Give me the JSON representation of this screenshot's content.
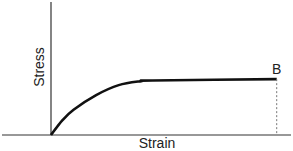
{
  "chart_data": {
    "type": "line",
    "title": "",
    "xlabel": "Strain",
    "ylabel": "Stress",
    "grid": false,
    "legend": "none",
    "x_ticks": [],
    "y_ticks": [],
    "series": [
      {
        "name": "stress-strain curve",
        "description": "Rises from origin with decreasing slope, then plateaus at a constant stress until point B",
        "points": [
          {
            "x": 0.0,
            "y": 0.0
          },
          {
            "x": 0.05,
            "y": 0.22
          },
          {
            "x": 0.1,
            "y": 0.38
          },
          {
            "x": 0.2,
            "y": 0.6
          },
          {
            "x": 0.3,
            "y": 0.75
          },
          {
            "x": 0.4,
            "y": 0.81
          },
          {
            "x": 0.45,
            "y": 0.82
          },
          {
            "x": 1.0,
            "y": 0.84
          }
        ],
        "color": "#111111"
      }
    ],
    "annotations": [
      {
        "label": "B",
        "x": 1.0,
        "y": 0.84,
        "dropline": "dashed vertical to strain axis"
      }
    ],
    "xlim": [
      0,
      1.05
    ],
    "ylim": [
      0,
      2.0
    ]
  }
}
